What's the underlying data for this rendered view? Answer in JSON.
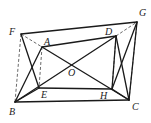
{
  "diagram": {
    "type": "geometry",
    "points": [
      {
        "name": "F",
        "label": "F"
      },
      {
        "name": "A",
        "label": "A"
      },
      {
        "name": "D",
        "label": "D"
      },
      {
        "name": "G",
        "label": "G"
      },
      {
        "name": "O",
        "label": "O"
      },
      {
        "name": "B",
        "label": "B"
      },
      {
        "name": "E",
        "label": "E"
      },
      {
        "name": "H",
        "label": "H"
      },
      {
        "name": "C",
        "label": "C"
      }
    ],
    "solid_segments": [
      [
        "F",
        "G"
      ],
      [
        "G",
        "C"
      ],
      [
        "C",
        "B"
      ],
      [
        "B",
        "F_skip"
      ],
      [
        "A",
        "D"
      ],
      [
        "D",
        "H"
      ],
      [
        "H",
        "E"
      ],
      [
        "E",
        "A_skip"
      ],
      [
        "A",
        "C"
      ],
      [
        "B",
        "D"
      ],
      [
        "F",
        "E"
      ],
      [
        "B",
        "A"
      ],
      [
        "D",
        "C"
      ],
      [
        "G",
        "H"
      ],
      [
        "B",
        "E"
      ],
      [
        "H",
        "C"
      ]
    ],
    "dashed_segments": [
      [
        "F",
        "A"
      ],
      [
        "D",
        "G"
      ],
      [
        "F",
        "B"
      ],
      [
        "A",
        "E"
      ],
      [
        "D",
        "H"
      ],
      [
        "G",
        "C"
      ]
    ]
  }
}
